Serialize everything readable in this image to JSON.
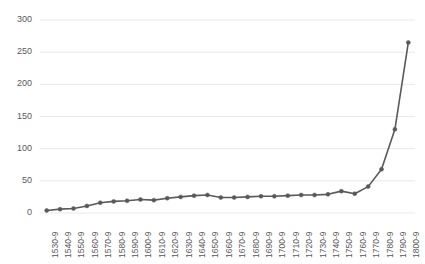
{
  "chart_data": {
    "type": "line",
    "title": "",
    "subtitle": "",
    "xlabel": "",
    "ylabel": "",
    "legend": [],
    "legend_position": "none",
    "grid": true,
    "grid_axis": "y",
    "marker": "circle",
    "line_color": "#595959",
    "marker_color": "#595959",
    "ylim": [
      0,
      300
    ],
    "yticks": [
      0,
      50,
      100,
      150,
      200,
      250,
      300
    ],
    "ytick_labels": [
      "0",
      "50",
      "100",
      "150",
      "200",
      "250",
      "300"
    ],
    "categories": [
      "1530-9",
      "1540-9",
      "1550-9",
      "1560-9",
      "1570-9",
      "1580-9",
      "1590-9",
      "1600-9",
      "1610-9",
      "1620-9",
      "1630-9",
      "1640-9",
      "1650-9",
      "1660-9",
      "1670-9",
      "1680-9",
      "1690-9",
      "1700-9",
      "1710-9",
      "1720-9",
      "1730-9",
      "1740-9",
      "1750-9",
      "1760-9",
      "1770-9",
      "1780-9",
      "1790-9",
      "1800-9"
    ],
    "values": [
      4,
      6,
      7,
      11,
      16,
      18,
      19,
      21,
      20,
      23,
      25,
      27,
      28,
      24,
      24,
      25,
      26,
      26,
      27,
      28,
      28,
      29,
      34,
      30,
      41,
      68,
      130,
      265
    ],
    "series": [
      {
        "name": "series-1",
        "values": [
          4,
          6,
          7,
          11,
          16,
          18,
          19,
          21,
          20,
          23,
          25,
          27,
          28,
          24,
          24,
          25,
          26,
          26,
          27,
          28,
          28,
          29,
          34,
          30,
          41,
          68,
          130,
          265
        ]
      }
    ]
  },
  "colors": {
    "line": "#595959",
    "grid": "#e8e8e8",
    "tick_text": "#595959",
    "background": "#ffffff"
  }
}
